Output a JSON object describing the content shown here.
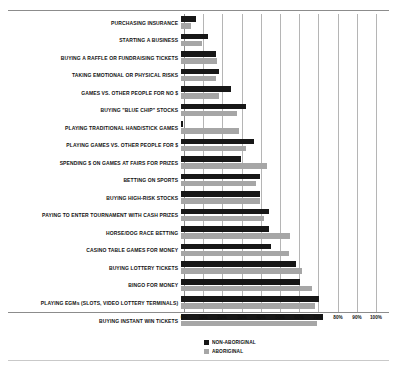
{
  "chart_data": {
    "type": "bar",
    "orientation": "horizontal",
    "title": "",
    "xlabel": "",
    "ylabel": "",
    "xlim": [
      0,
      100
    ],
    "xticks": [
      "0%",
      "10%",
      "20%",
      "30%",
      "40%",
      "50%",
      "60%",
      "70%",
      "80%",
      "90%",
      "100%"
    ],
    "grid": true,
    "legend_position": "bottom-center",
    "categories": [
      "PURCHASING INSURANCE",
      "STARTING A BUSINESS",
      "BUYING A RAFFLE OR FUNDRAISING TICKETS",
      "TAKING EMOTIONAL OR PHYSICAL RISKS",
      "GAMES VS. OTHER PEOPLE FOR NO $",
      "BUYING \"BLUE CHIP\" STOCKS",
      "PLAYING TRADITIONAL HAND/STICK GAMES",
      "PLAYING GAMES VS. OTHER PEOPLE FOR $",
      "SPENDING $ ON GAMES AT FAIRS FOR PRIZES",
      "BETTING ON SPORTS",
      "BUYING HIGH-RISK STOCKS",
      "PAYING TO ENTER TOURNAMENT WITH CASH PRIZES",
      "HORSE/DOG RACE BETTING",
      "CASINO TABLE GAMES FOR MONEY",
      "BUYING LOTTERY TICKETS",
      "BINGO FOR MONEY",
      "PLAYING EGMs (SLOTS, VIDEO LOTTERY TERMINALS)",
      "BUYING INSTANT WIN TICKETS"
    ],
    "series": [
      {
        "name": "NON-ABORIGINAL",
        "color": "#171717",
        "values": [
          8,
          14,
          18,
          20,
          26,
          34,
          1,
          38,
          31,
          41,
          41,
          46,
          46,
          47,
          60,
          62,
          72,
          74
        ]
      },
      {
        "name": "ABORIGINAL",
        "color": "#a6a6a6",
        "values": [
          5,
          11,
          19,
          18,
          20,
          29,
          30,
          34,
          45,
          39,
          41,
          43,
          57,
          56,
          63,
          68,
          70,
          71
        ]
      }
    ]
  },
  "legend": {
    "items": [
      {
        "label": "NON-ABORIGINAL",
        "color": "#171717"
      },
      {
        "label": "ABORIGINAL",
        "color": "#a6a6a6"
      }
    ]
  }
}
